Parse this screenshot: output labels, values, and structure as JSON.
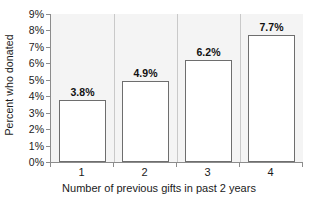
{
  "chart_data": {
    "type": "bar",
    "title": "",
    "categories": [
      "1",
      "2",
      "3",
      "4"
    ],
    "values": [
      3.8,
      4.9,
      6.2,
      7.7
    ],
    "data_labels": [
      "3.8%",
      "4.9%",
      "6.2%",
      "7.7%"
    ],
    "xlabel": "Number of previous gifts in past 2 years",
    "ylabel": "Percent who donated",
    "ylim": [
      0,
      9
    ],
    "ytick_labels": [
      "0%",
      "1%",
      "2%",
      "3%",
      "4%",
      "5%",
      "6%",
      "7%",
      "8%",
      "9%"
    ],
    "ytick_values": [
      0,
      1,
      2,
      3,
      4,
      5,
      6,
      7,
      8,
      9
    ],
    "grid": false,
    "legend": null,
    "bar_fill_color": "#ffffff",
    "bar_border_color": "#6e6e6e",
    "plot_background_color": "#f4f4f4",
    "axis_color": "#8c8c8c",
    "text_color": "#1a1a1a"
  }
}
